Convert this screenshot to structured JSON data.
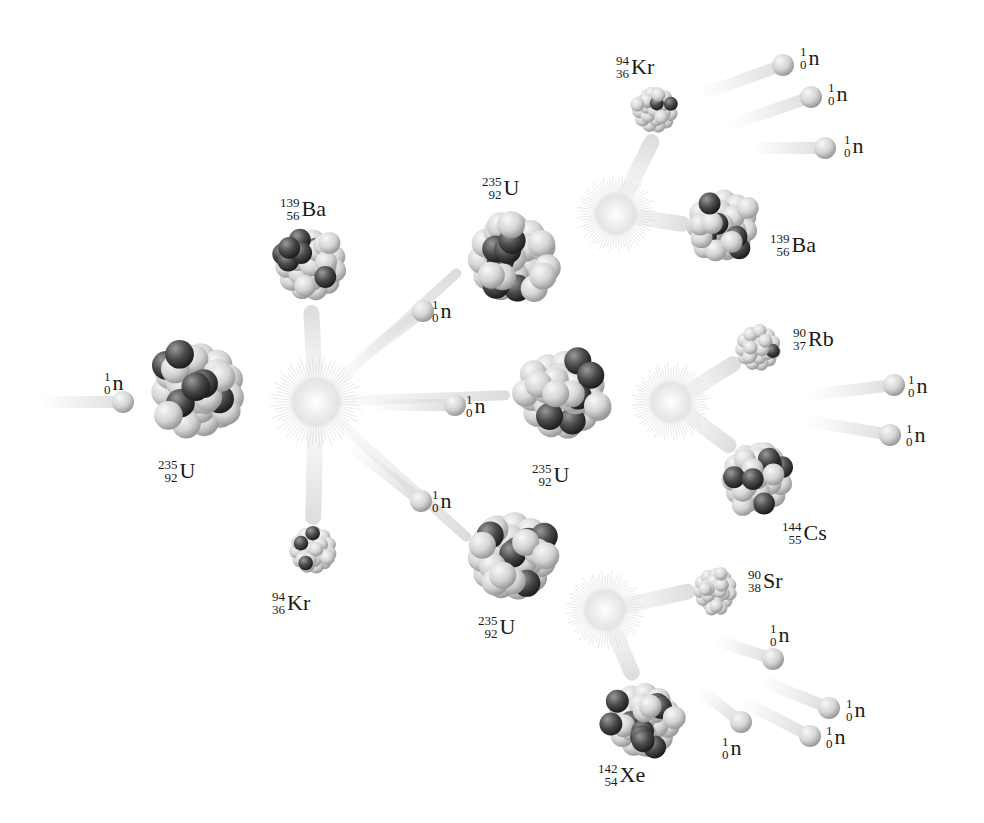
{
  "colors": {
    "background": "#ffffff",
    "neutron": "#cfcfcf",
    "proton": "#555555",
    "light_nucleon": "#d9d9d9",
    "text": "#1a1a1a"
  },
  "flashes": [
    {
      "id": "flash-1",
      "x": 316,
      "y": 402,
      "r": 40
    },
    {
      "id": "flash-2",
      "x": 616,
      "y": 214,
      "r": 34
    },
    {
      "id": "flash-3",
      "x": 671,
      "y": 402,
      "r": 34
    },
    {
      "id": "flash-4",
      "x": 605,
      "y": 610,
      "r": 34
    }
  ],
  "nuclei": [
    {
      "id": "u235-initial",
      "x": 198,
      "y": 390,
      "r": 55,
      "label": {
        "mass": "235",
        "atomic": "92",
        "symbol": "U",
        "x": 158,
        "y": 458
      }
    },
    {
      "id": "ba139-gen1",
      "x": 311,
      "y": 265,
      "r": 42,
      "label": {
        "mass": "139",
        "atomic": "56",
        "symbol": "Ba",
        "x": 280,
        "y": 196
      }
    },
    {
      "id": "kr94-gen1",
      "x": 313,
      "y": 550,
      "r": 28,
      "label": {
        "mass": "94",
        "atomic": "36",
        "symbol": "Kr",
        "x": 272,
        "y": 590
      }
    },
    {
      "id": "u235-top",
      "x": 512,
      "y": 258,
      "r": 52,
      "label": {
        "mass": "235",
        "atomic": "92",
        "symbol": "U",
        "x": 482,
        "y": 175
      }
    },
    {
      "id": "u235-mid",
      "x": 562,
      "y": 395,
      "r": 52,
      "label": {
        "mass": "235",
        "atomic": "92",
        "symbol": "U",
        "x": 532,
        "y": 462
      }
    },
    {
      "id": "u235-bottom",
      "x": 512,
      "y": 556,
      "r": 52,
      "label": {
        "mass": "235",
        "atomic": "92",
        "symbol": "U",
        "x": 478,
        "y": 614
      }
    },
    {
      "id": "kr94-gen2",
      "x": 655,
      "y": 110,
      "r": 27,
      "label": {
        "mass": "94",
        "atomic": "36",
        "symbol": "Kr",
        "x": 616,
        "y": 54
      }
    },
    {
      "id": "ba139-gen2",
      "x": 722,
      "y": 225,
      "r": 42,
      "label": {
        "mass": "139",
        "atomic": "56",
        "symbol": "Ba",
        "x": 770,
        "y": 232
      }
    },
    {
      "id": "rb90",
      "x": 758,
      "y": 348,
      "r": 27,
      "label": {
        "mass": "90",
        "atomic": "37",
        "symbol": "Rb",
        "x": 793,
        "y": 326
      }
    },
    {
      "id": "cs144",
      "x": 757,
      "y": 478,
      "r": 42,
      "label": {
        "mass": "144",
        "atomic": "55",
        "symbol": "Cs",
        "x": 782,
        "y": 520
      }
    },
    {
      "id": "sr90",
      "x": 715,
      "y": 590,
      "r": 26,
      "label": {
        "mass": "90",
        "atomic": "38",
        "symbol": "Sr",
        "x": 748,
        "y": 568
      }
    },
    {
      "id": "xe142",
      "x": 643,
      "y": 720,
      "r": 44,
      "label": {
        "mass": "142",
        "atomic": "54",
        "symbol": "Xe",
        "x": 598,
        "y": 762
      }
    }
  ],
  "neutrons": [
    {
      "id": "n-incoming",
      "x": 123,
      "y": 402,
      "label_x": 104,
      "label_y": 370,
      "trail": [
        [
          40,
          402
        ]
      ]
    },
    {
      "id": "n-gen1-a",
      "x": 423,
      "y": 311,
      "label_x": 432,
      "label_y": 298,
      "trail": [
        [
          352,
          365
        ]
      ]
    },
    {
      "id": "n-gen1-b",
      "x": 455,
      "y": 405,
      "label_x": 466,
      "label_y": 393,
      "trail": [
        [
          370,
          405
        ]
      ]
    },
    {
      "id": "n-gen1-c",
      "x": 421,
      "y": 501,
      "label_x": 432,
      "label_y": 488,
      "trail": [
        [
          350,
          445
        ]
      ]
    },
    {
      "id": "n-gen2-top-1",
      "x": 783,
      "y": 65,
      "label_x": 800,
      "label_y": 45,
      "trail": [
        [
          700,
          95
        ]
      ]
    },
    {
      "id": "n-gen2-top-2",
      "x": 811,
      "y": 97,
      "label_x": 828,
      "label_y": 81,
      "trail": [
        [
          730,
          125
        ]
      ]
    },
    {
      "id": "n-gen2-top-3",
      "x": 825,
      "y": 148,
      "label_x": 844,
      "label_y": 133,
      "trail": [
        [
          750,
          148
        ]
      ]
    },
    {
      "id": "n-gen2-mid-1",
      "x": 894,
      "y": 385,
      "label_x": 908,
      "label_y": 373,
      "trail": [
        [
          810,
          395
        ]
      ]
    },
    {
      "id": "n-gen2-mid-2",
      "x": 890,
      "y": 435,
      "label_x": 906,
      "label_y": 422,
      "trail": [
        [
          805,
          420
        ]
      ]
    },
    {
      "id": "n-gen2-bot-1",
      "x": 773,
      "y": 659,
      "label_x": 770,
      "label_y": 622,
      "trail": [
        [
          715,
          640
        ]
      ]
    },
    {
      "id": "n-gen2-bot-2",
      "x": 829,
      "y": 708,
      "label_x": 846,
      "label_y": 697,
      "trail": [
        [
          760,
          680
        ]
      ]
    },
    {
      "id": "n-gen2-bot-3",
      "x": 741,
      "y": 722,
      "label_x": 722,
      "label_y": 735,
      "trail": [
        [
          700,
          690
        ]
      ]
    },
    {
      "id": "n-gen2-bot-4",
      "x": 810,
      "y/i": 0,
      "y": 736,
      "label_x": 826,
      "label_y": 724,
      "trail": [
        [
          740,
          700
        ]
      ]
    }
  ],
  "neutron_label": {
    "mass": "1",
    "atomic": "0",
    "symbol": "n"
  },
  "trails": [
    {
      "from": [
        316,
        402
      ],
      "to": [
        311,
        305
      ]
    },
    {
      "from": [
        316,
        402
      ],
      "to": [
        313,
        525
      ]
    },
    {
      "from": [
        616,
        214
      ],
      "to": [
        655,
        135
      ]
    },
    {
      "from": [
        616,
        214
      ],
      "to": [
        690,
        225
      ]
    },
    {
      "from": [
        671,
        402
      ],
      "to": [
        740,
        360
      ]
    },
    {
      "from": [
        671,
        402
      ],
      "to": [
        735,
        450
      ]
    },
    {
      "from": [
        605,
        610
      ],
      "to": [
        695,
        590
      ]
    },
    {
      "from": [
        605,
        610
      ],
      "to": [
        635,
        680
      ]
    }
  ]
}
